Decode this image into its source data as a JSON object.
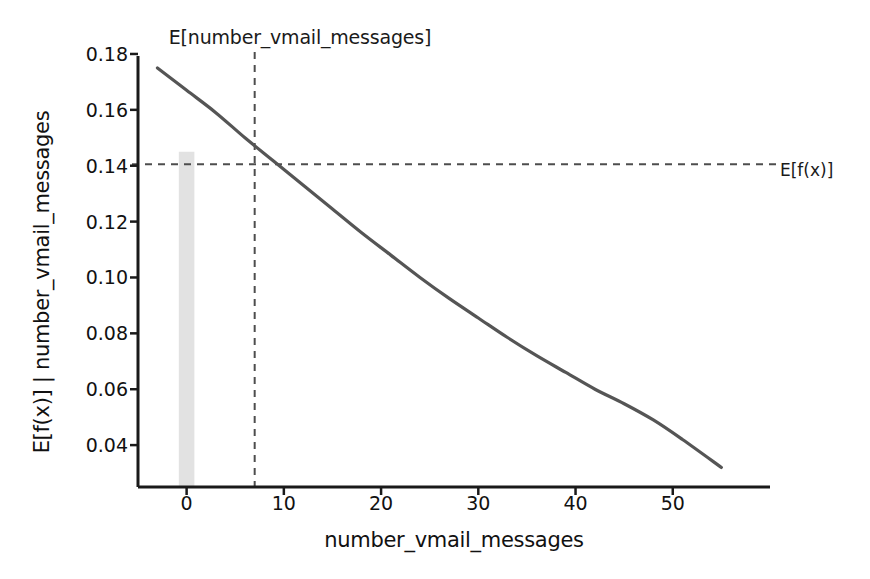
{
  "chart_data": {
    "type": "line",
    "title": "E[number_vmail_messages]",
    "xlabel": "number_vmail_messages",
    "ylabel": "E[f(x)] | number_vmail_messages",
    "xlim": [
      -5,
      60
    ],
    "ylim": [
      0.025,
      0.185
    ],
    "grid": false,
    "legend_position": "none",
    "xticks": [
      0,
      10,
      20,
      30,
      40,
      50
    ],
    "xtick_labels": [
      "0",
      "10",
      "20",
      "30",
      "40",
      "50"
    ],
    "yticks": [
      0.04,
      0.06,
      0.08,
      0.1,
      0.12,
      0.14,
      0.16,
      0.18
    ],
    "ytick_labels": [
      "0.04",
      "0.06",
      "0.08",
      "0.10",
      "0.12",
      "0.14",
      "0.16",
      "0.18"
    ],
    "series": [
      {
        "name": "partial_dependence",
        "type": "line",
        "color": "#555555",
        "linewidth": 3.2,
        "x": [
          -3,
          0,
          3,
          6,
          9,
          12,
          15,
          18,
          21,
          24,
          27,
          30,
          33,
          36,
          39,
          42,
          45,
          48,
          51,
          55
        ],
        "y": [
          0.175,
          0.167,
          0.159,
          0.15,
          0.1415,
          0.133,
          0.1245,
          0.116,
          0.108,
          0.1,
          0.0925,
          0.0855,
          0.0785,
          0.072,
          0.066,
          0.06,
          0.0548,
          0.049,
          0.042,
          0.032
        ]
      },
      {
        "name": "distribution_histogram",
        "type": "bar",
        "color": "#e2e2e2",
        "x": [
          0
        ],
        "values": [
          0.145
        ],
        "bar_width": 1.6,
        "baseline": 0.025
      }
    ],
    "annotations": [
      {
        "name": "mean-feature-vline",
        "type": "vline",
        "x": 7,
        "label": "E[number_vmail_messages]",
        "style": "dashed",
        "color": "#4d4d4d"
      },
      {
        "name": "mean-prediction-hline",
        "type": "hline",
        "y": 0.1405,
        "label": "E[f(x)]",
        "style": "dashed",
        "color": "#4d4d4d"
      }
    ],
    "intersection_point": {
      "x": 7,
      "y": 0.1405
    }
  },
  "labels": {
    "title": "E[number_vmail_messages]",
    "ylabel": "E[f(x)] | number_vmail_messages",
    "xlabel": "number_vmail_messages",
    "right_annotation": "E[f(x)]"
  },
  "colors": {
    "curve": "#555555",
    "dashed": "#4d4d4d",
    "bar": "#e2e2e2",
    "axis": "#1a1a1a",
    "text": "#111111",
    "background": "#ffffff"
  }
}
